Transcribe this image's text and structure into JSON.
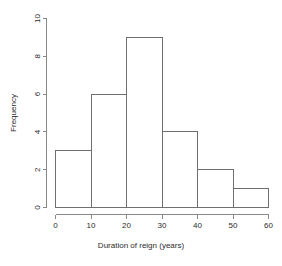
{
  "chart_data": {
    "type": "bar",
    "title": "",
    "subtitle": "",
    "xlabel": "Duration of reign (years)",
    "ylabel": "Frequency",
    "categories": [
      "0-10",
      "10-20",
      "20-30",
      "30-40",
      "40-50",
      "50-60"
    ],
    "bin_edges": [
      0,
      10,
      20,
      30,
      40,
      50,
      60
    ],
    "values": [
      3,
      6,
      9,
      4,
      2,
      1
    ],
    "xlim": [
      0,
      60
    ],
    "ylim": [
      0,
      10
    ],
    "xticks": [
      "0",
      "10",
      "20",
      "30",
      "40",
      "50",
      "60"
    ],
    "xtick_values": [
      0,
      10,
      20,
      30,
      40,
      50,
      60
    ],
    "yticks": [
      "0",
      "2",
      "4",
      "6",
      "8",
      "10"
    ],
    "ytick_values": [
      0,
      2,
      4,
      6,
      8,
      10
    ],
    "grid": false,
    "legend": null,
    "bar_fill": "none",
    "bar_stroke": "#6f6f6f",
    "axis_color": "#8a8a8a",
    "text_color": "#2b2b2b",
    "background": "#ffffff",
    "ytick_label_rotation": -90
  }
}
